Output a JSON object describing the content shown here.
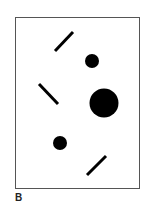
{
  "figure": {
    "label": "B",
    "frame": {
      "x": 15,
      "y": 17,
      "width": 124,
      "height": 171,
      "stroke": "#555555"
    },
    "circles": [
      {
        "cx": 92,
        "cy": 61,
        "r": 7
      },
      {
        "cx": 104,
        "cy": 103,
        "r": 14.5
      },
      {
        "cx": 60,
        "cy": 143,
        "r": 7
      }
    ],
    "lines": [
      {
        "x1": 55,
        "y1": 51,
        "x2": 73,
        "y2": 32
      },
      {
        "x1": 39,
        "y1": 84,
        "x2": 58,
        "y2": 104
      },
      {
        "x1": 87,
        "y1": 175,
        "x2": 106,
        "y2": 156
      }
    ],
    "fill": "#000000"
  }
}
